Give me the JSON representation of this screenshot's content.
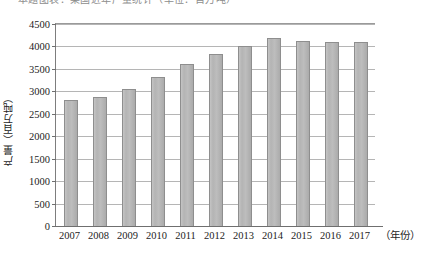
{
  "caption_sliver": "本题图表：某国近年产量统计（单位：百万吨）",
  "chart_data": {
    "type": "bar",
    "title": "",
    "subtitle": "",
    "xlabel": "（年份）",
    "ylabel": "产量（百万吨）",
    "categories": [
      "2007",
      "2008",
      "2009",
      "2010",
      "2011",
      "2012",
      "2013",
      "2014",
      "2015",
      "2016",
      "2017"
    ],
    "values": [
      2800,
      2870,
      3050,
      3320,
      3600,
      3830,
      4020,
      4180,
      4120,
      4110,
      4110
    ],
    "ylim": [
      0,
      4500
    ],
    "ytick_step": 500,
    "ytick_labels": [
      "0",
      "500",
      "1000",
      "1500",
      "2000",
      "2500",
      "3000",
      "3500",
      "4000",
      "4500"
    ],
    "grid": true,
    "legend": "none",
    "series_name": "产量",
    "bar_color": "#b6b6b6",
    "bar_edge_color": "#8e8e8e",
    "grid_color": "#b5b5b5",
    "axis_color": "#6f6f6f"
  }
}
